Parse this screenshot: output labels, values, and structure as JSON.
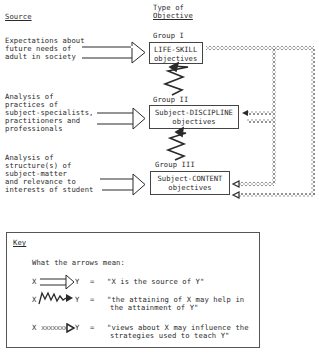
{
  "headers": {
    "source": "Source",
    "type_line1": "Type of",
    "type_line2": "Objective"
  },
  "sources": [
    {
      "lines": [
        "Expectations about",
        "future needs of",
        "adult in society"
      ]
    },
    {
      "lines": [
        "Analysis of",
        "practices of",
        "subject-specialists,",
        "practitioners and",
        "professionals"
      ]
    },
    {
      "lines": [
        "Analysis of",
        "structure(s) of",
        "subject-matter",
        "and relevance to",
        "interests of student"
      ]
    }
  ],
  "objectives": [
    {
      "group": "Group I",
      "line1": "LIFE-SKILL",
      "line2": "objectives"
    },
    {
      "group": "Group II",
      "line1": "Subject-DISCIPLINE",
      "line2": "objectives"
    },
    {
      "group": "Group III",
      "line1": "Subject-CONTENT",
      "line2": "objectives"
    }
  ],
  "key": {
    "title": "Key",
    "intro": "What the arrows mean:",
    "items": [
      {
        "x": "X",
        "y": "Y",
        "eq": "=",
        "meaning_lines": [
          "\"X is the source of Y\""
        ],
        "arrow": "double-line-arrow"
      },
      {
        "x": "X",
        "y": "Y",
        "eq": "=",
        "meaning_lines": [
          "\"the attaining of X may help in",
          "the attainment of Y\""
        ],
        "arrow": "zigzag-arrow"
      },
      {
        "x": "X",
        "y": "Y",
        "eq": "=",
        "meaning_lines": [
          "\"views about X may influence the",
          "strategies used to teach Y\""
        ],
        "arrow": "cross-line-arrow",
        "x_marks": "xxxxxxx"
      }
    ]
  },
  "colors": {
    "ink": "#2a2a2a",
    "cross_line": "#777777"
  }
}
